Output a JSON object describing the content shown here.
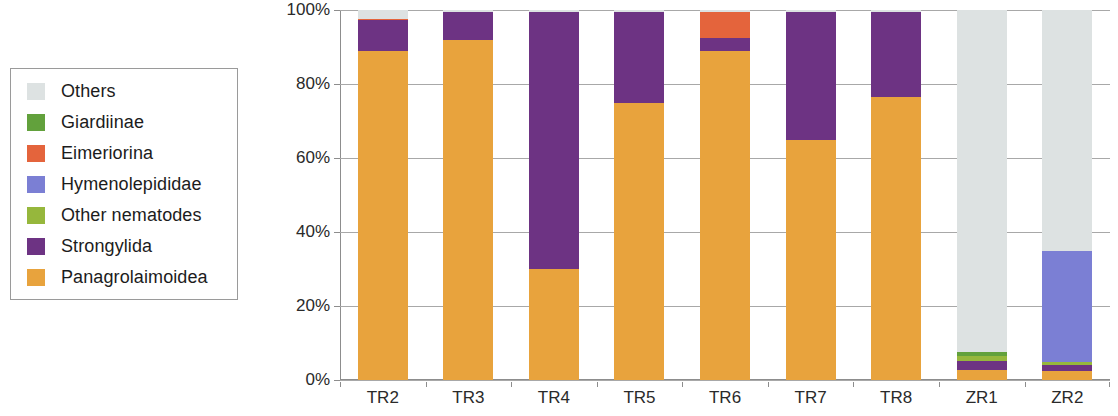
{
  "chart_data": {
    "type": "bar",
    "stacked": true,
    "normalized": true,
    "title": "",
    "subtitle": "",
    "xlabel": "",
    "ylabel": "",
    "ylim": [
      0,
      100
    ],
    "ytick_labels": [
      "0%",
      "20%",
      "40%",
      "60%",
      "80%",
      "100%"
    ],
    "ytick_values": [
      0,
      20,
      40,
      60,
      80,
      100
    ],
    "grid": true,
    "legend_position": "left-outside",
    "categories": [
      "TR2",
      "TR3",
      "TR4",
      "TR5",
      "TR6",
      "TR7",
      "TR8",
      "ZR1",
      "ZR2"
    ],
    "series": [
      {
        "name": "Others",
        "color": "#dde2e2",
        "values": [
          2.5,
          0.6,
          0.6,
          0.6,
          0.6,
          0.6,
          0.6,
          92.5,
          65.0
        ]
      },
      {
        "name": "Giardiinae",
        "color": "#62a13c",
        "values": [
          0.0,
          0.0,
          0.0,
          0.0,
          0.0,
          0.0,
          0.0,
          1.0,
          0.0
        ]
      },
      {
        "name": "Eimeriorina",
        "color": "#e4643c",
        "values": [
          0.3,
          0.0,
          0.0,
          0.0,
          7.0,
          0.0,
          0.0,
          0.0,
          0.0
        ]
      },
      {
        "name": "Hymenolepididae",
        "color": "#7b7fd4",
        "values": [
          0.0,
          0.0,
          0.0,
          0.0,
          0.0,
          0.0,
          0.0,
          0.0,
          30.0
        ]
      },
      {
        "name": "Other nematodes",
        "color": "#96b73c",
        "values": [
          0.0,
          0.0,
          0.0,
          0.0,
          0.0,
          0.0,
          0.0,
          1.3,
          1.0
        ]
      },
      {
        "name": "Strongylida",
        "color": "#6d3383",
        "values": [
          8.2,
          7.4,
          69.4,
          24.4,
          3.4,
          34.4,
          22.9,
          2.4,
          1.5
        ]
      },
      {
        "name": "Panagrolaimoidea",
        "color": "#e8a33d",
        "values": [
          89.0,
          92.0,
          30.0,
          75.0,
          89.0,
          65.0,
          76.5,
          2.8,
          2.5
        ]
      }
    ]
  },
  "legend": {
    "items": [
      {
        "label": "Others",
        "color": "#dde2e2"
      },
      {
        "label": "Giardiinae",
        "color": "#62a13c"
      },
      {
        "label": "Eimeriorina",
        "color": "#e4643c"
      },
      {
        "label": "Hymenolepididae",
        "color": "#7b7fd4"
      },
      {
        "label": "Other nematodes",
        "color": "#96b73c"
      },
      {
        "label": "Strongylida",
        "color": "#6d3383"
      },
      {
        "label": "Panagrolaimoidea",
        "color": "#e8a33d"
      }
    ]
  }
}
